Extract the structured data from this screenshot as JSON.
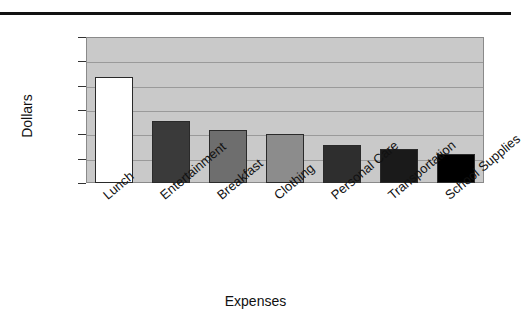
{
  "chart_data": {
    "type": "bar",
    "title": "",
    "xlabel": "Expenses",
    "ylabel": "Dollars",
    "categories": [
      "Lunch",
      "Entertainment",
      "Breakfast",
      "Clothing",
      "Personal Care",
      "Transportation",
      "School Supplies"
    ],
    "values": [
      21.7,
      12.7,
      10.8,
      10.1,
      7.8,
      7.0,
      6.0
    ],
    "bar_colors": [
      "#ffffff",
      "#3a3a3a",
      "#6e6e6e",
      "#8c8c8c",
      "#2e2e2e",
      "#1a1a1a",
      "#000000"
    ],
    "bar_edge_color": "#2a2a2a",
    "ylim": [
      0,
      30
    ],
    "ytick_values": [
      0,
      5,
      10,
      15,
      20,
      25,
      30
    ],
    "ytick_labels": [
      "$0",
      "$5",
      "$10",
      "$15",
      "$20",
      "$25",
      "$30"
    ],
    "grid": true,
    "legend": "none",
    "plot_background": "#c9c9c9",
    "gridline_color": "#9a9a9a",
    "figure_background": "#ffffff"
  },
  "decorations": {
    "top_rule_color": "#111111"
  }
}
